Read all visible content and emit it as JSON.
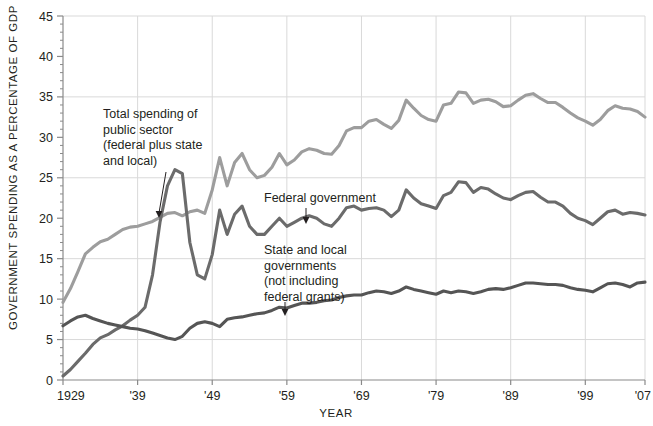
{
  "chart_data": {
    "type": "line",
    "title": "",
    "xlabel": "YEAR",
    "ylabel": "GOVERNMENT SPENDING AS A PERCENTAGE OF GDP",
    "xlim": [
      1929,
      2007
    ],
    "ylim": [
      0,
      45
    ],
    "grid": true,
    "grid_y_values": [
      5,
      15,
      25,
      35,
      45
    ],
    "y_ticks_major": [
      0,
      5,
      10,
      15,
      20,
      25,
      30,
      35,
      40,
      45
    ],
    "y_tick_labels": [
      "0",
      "5",
      "10",
      "15",
      "20",
      "25",
      "30",
      "35",
      "40",
      "45"
    ],
    "x_ticks": [
      1929,
      1939,
      1949,
      1959,
      1969,
      1979,
      1989,
      1999,
      2007
    ],
    "x_tick_labels": [
      "1929",
      "'39",
      "'49",
      "'59",
      "'69",
      "'79",
      "'89",
      "'99",
      "'07"
    ],
    "legend": "none",
    "annotations": [
      {
        "name": "total-spending-annotation",
        "text_lines": [
          "Total spending of",
          "public sector",
          "(federal plus state",
          "and local)"
        ],
        "text_x": 103,
        "text_y": 118,
        "arrow_from_x": 166,
        "arrow_from_y": 172,
        "arrow_to_x": 159,
        "arrow_to_y": 218
      },
      {
        "name": "federal-government-annotation",
        "text_lines": [
          "Federal government"
        ],
        "text_x": 264,
        "text_y": 202,
        "arrow_from_x": 306,
        "arrow_from_y": 208,
        "arrow_to_x": 306,
        "arrow_to_y": 224
      },
      {
        "name": "state-local-annotation",
        "text_lines": [
          "State and local",
          "governments",
          "(not including",
          "federal grants)"
        ],
        "text_x": 264,
        "text_y": 254,
        "arrow_from_x": 285,
        "arrow_from_y": 302,
        "arrow_to_x": 285,
        "arrow_to_y": 316
      }
    ],
    "colors": {
      "total": "#9d9d9d",
      "federal": "#6b6b6b",
      "state_local": "#555555",
      "grid": "#d9d9d9",
      "axis": "#8a8a8a",
      "text": "#231f20",
      "background": "#ffffff"
    },
    "x": [
      1929,
      1930,
      1931,
      1932,
      1933,
      1934,
      1935,
      1936,
      1937,
      1938,
      1939,
      1940,
      1941,
      1942,
      1943,
      1944,
      1945,
      1946,
      1947,
      1948,
      1949,
      1950,
      1951,
      1952,
      1953,
      1954,
      1955,
      1956,
      1957,
      1958,
      1959,
      1960,
      1961,
      1962,
      1963,
      1964,
      1965,
      1966,
      1967,
      1968,
      1969,
      1970,
      1971,
      1972,
      1973,
      1974,
      1975,
      1976,
      1977,
      1978,
      1979,
      1980,
      1981,
      1982,
      1983,
      1984,
      1985,
      1986,
      1987,
      1988,
      1989,
      1990,
      1991,
      1992,
      1993,
      1994,
      1995,
      1996,
      1997,
      1998,
      1999,
      2000,
      2001,
      2002,
      2003,
      2004,
      2005,
      2006,
      2007
    ],
    "series": [
      {
        "name": "Total spending of public sector (federal plus state and local)",
        "short_name": "total",
        "color": "#9d9d9d",
        "values": [
          9.6,
          11.3,
          13.4,
          15.6,
          16.4,
          17.1,
          17.4,
          18.0,
          18.6,
          18.9,
          19.0,
          19.3,
          19.6,
          20.1,
          20.6,
          20.7,
          20.3,
          20.8,
          21.0,
          20.6,
          23.5,
          27.5,
          24.0,
          26.9,
          28.0,
          26.0,
          25.0,
          25.3,
          26.3,
          28.0,
          26.6,
          27.2,
          28.2,
          28.6,
          28.4,
          28.0,
          27.9,
          29.0,
          30.8,
          31.2,
          31.2,
          32.0,
          32.2,
          31.6,
          31.1,
          32.1,
          34.6,
          33.6,
          32.7,
          32.2,
          32.0,
          34.0,
          34.2,
          35.6,
          35.5,
          34.2,
          34.6,
          34.7,
          34.4,
          33.8,
          33.9,
          34.6,
          35.2,
          35.4,
          34.8,
          34.3,
          34.3,
          33.7,
          33.0,
          32.4,
          32.0,
          31.5,
          32.2,
          33.3,
          33.9,
          33.6,
          33.5,
          33.2,
          32.5
        ]
      },
      {
        "name": "Federal government",
        "short_name": "federal",
        "color": "#6b6b6b",
        "values": [
          0.5,
          1.3,
          2.3,
          3.3,
          4.4,
          5.2,
          5.6,
          6.2,
          6.7,
          7.4,
          8.0,
          9.0,
          13.0,
          19.5,
          24.0,
          26.0,
          25.5,
          17.0,
          13.0,
          12.5,
          15.5,
          21.0,
          18.0,
          20.5,
          21.5,
          19.0,
          18.0,
          18.0,
          19.0,
          20.0,
          19.0,
          19.5,
          20.0,
          20.3,
          20.0,
          19.3,
          19.0,
          20.0,
          21.3,
          21.5,
          21.0,
          21.2,
          21.3,
          21.0,
          20.2,
          21.0,
          23.5,
          22.5,
          21.8,
          21.5,
          21.2,
          22.8,
          23.2,
          24.5,
          24.4,
          23.2,
          23.8,
          23.6,
          23.0,
          22.5,
          22.3,
          22.8,
          23.2,
          23.3,
          22.6,
          22.0,
          22.0,
          21.5,
          20.6,
          20.0,
          19.7,
          19.2,
          20.0,
          20.8,
          21.0,
          20.5,
          20.7,
          20.6,
          20.4
        ]
      },
      {
        "name": "State and local governments (not including federal grants)",
        "short_name": "state_local",
        "color": "#555555",
        "values": [
          6.7,
          7.3,
          7.8,
          8.0,
          7.6,
          7.3,
          7.0,
          6.8,
          6.6,
          6.4,
          6.3,
          6.1,
          5.8,
          5.5,
          5.2,
          5.0,
          5.4,
          6.4,
          7.0,
          7.2,
          7.0,
          6.6,
          7.5,
          7.7,
          7.8,
          8.0,
          8.2,
          8.3,
          8.6,
          9.0,
          8.9,
          9.2,
          9.5,
          9.5,
          9.6,
          9.8,
          9.9,
          10.2,
          10.4,
          10.5,
          10.5,
          10.8,
          11.0,
          10.9,
          10.7,
          11.0,
          11.5,
          11.2,
          11.0,
          10.8,
          10.6,
          11.0,
          10.8,
          11.0,
          10.9,
          10.7,
          10.9,
          11.2,
          11.3,
          11.2,
          11.4,
          11.7,
          12.0,
          12.0,
          11.9,
          11.8,
          11.8,
          11.7,
          11.4,
          11.2,
          11.1,
          10.9,
          11.4,
          11.9,
          12.0,
          11.8,
          11.5,
          12.0,
          12.1
        ]
      }
    ]
  }
}
